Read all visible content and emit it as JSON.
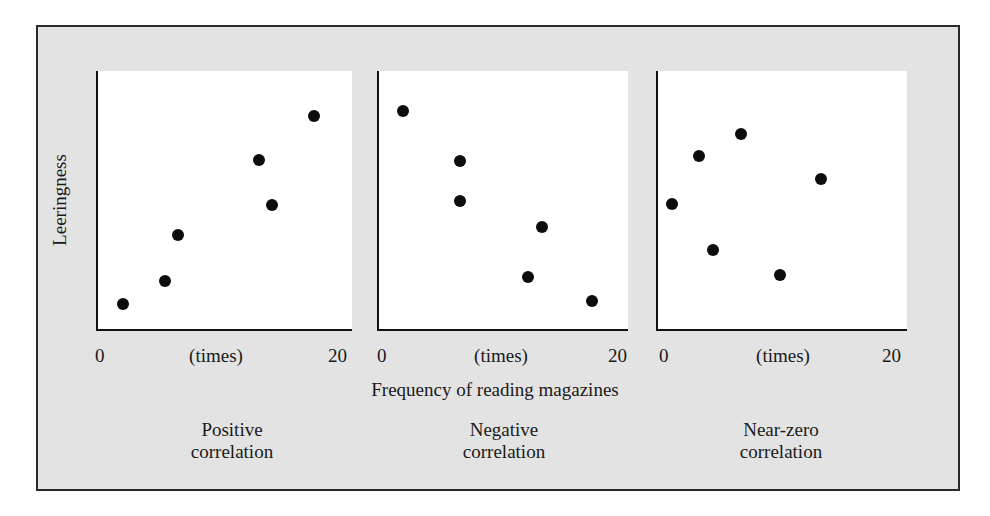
{
  "chart_data": [
    {
      "type": "scatter",
      "title": "Positive correlation",
      "caption": [
        "Positive",
        "correlation"
      ],
      "xlabel": "Frequency of reading magazines",
      "xunit": "(times)",
      "ylabel": "Leeringness",
      "xlim": [
        0,
        20
      ],
      "xticks": [
        "0",
        "20"
      ],
      "grid": false,
      "points": [
        {
          "x": 2.0,
          "y": 1.9
        },
        {
          "x": 5.3,
          "y": 3.7
        },
        {
          "x": 6.3,
          "y": 7.3
        },
        {
          "x": 12.7,
          "y": 13.1
        },
        {
          "x": 13.7,
          "y": 9.6
        },
        {
          "x": 17.0,
          "y": 16.5
        }
      ]
    },
    {
      "type": "scatter",
      "title": "Negative correlation",
      "caption": [
        "Negative",
        "correlation"
      ],
      "xlabel": "Frequency of reading magazines",
      "xunit": "(times)",
      "ylabel": "Leeringness",
      "xlim": [
        0,
        20
      ],
      "xticks": [
        "0",
        "20"
      ],
      "grid": false,
      "points": [
        {
          "x": 1.9,
          "y": 16.9
        },
        {
          "x": 6.5,
          "y": 13.0
        },
        {
          "x": 6.5,
          "y": 9.9
        },
        {
          "x": 13.1,
          "y": 7.9
        },
        {
          "x": 12.0,
          "y": 4.0
        },
        {
          "x": 17.1,
          "y": 2.2
        }
      ]
    },
    {
      "type": "scatter",
      "title": "Near-zero correlation",
      "caption": [
        "Near-zero",
        "correlation"
      ],
      "xlabel": "Frequency of reading magazines",
      "xunit": "(times)",
      "ylabel": "Leeringness",
      "xlim": [
        0,
        20
      ],
      "xticks": [
        "0",
        "20"
      ],
      "grid": false,
      "points": [
        {
          "x": 1.1,
          "y": 9.7
        },
        {
          "x": 3.3,
          "y": 13.4
        },
        {
          "x": 6.7,
          "y": 15.1
        },
        {
          "x": 4.4,
          "y": 6.1
        },
        {
          "x": 9.8,
          "y": 4.2
        },
        {
          "x": 13.1,
          "y": 11.6
        }
      ]
    }
  ],
  "labels": {
    "ylabel": "Leeringness",
    "xlabel": "Frequency of reading magazines",
    "xunit": "(times)",
    "tick_min": "0",
    "tick_max": "20",
    "captions": [
      {
        "line1": "Positive",
        "line2": "correlation"
      },
      {
        "line1": "Negative",
        "line2": "correlation"
      },
      {
        "line1": "Near-zero",
        "line2": "correlation"
      }
    ]
  },
  "colors": {
    "frame_bg": "#e3e3e3",
    "plot_bg": "#ffffff",
    "dot": "#0d0d0d",
    "axis": "#111111"
  }
}
